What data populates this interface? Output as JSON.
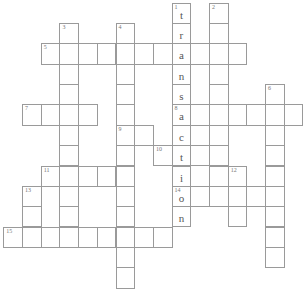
{
  "crossword": {
    "cell_w": 18.7,
    "cell_h": 20.35,
    "origin_x": 3.3,
    "origin_y": 2.7,
    "words": [
      {
        "number": "1",
        "direction": "down",
        "row": 0,
        "col": 9,
        "length": 11,
        "answer": "transaction"
      },
      {
        "number": "2",
        "direction": "down",
        "row": 0,
        "col": 11,
        "length": 9,
        "answer": ""
      },
      {
        "number": "3",
        "direction": "down",
        "row": 1,
        "col": 3,
        "length": 11,
        "answer": ""
      },
      {
        "number": "4",
        "direction": "down",
        "row": 1,
        "col": 6,
        "length": 13,
        "answer": ""
      },
      {
        "number": "5",
        "direction": "across",
        "row": 2,
        "col": 2,
        "length": 11,
        "answer": ""
      },
      {
        "number": "6",
        "direction": "down",
        "row": 4,
        "col": 14,
        "length": 9,
        "answer": ""
      },
      {
        "number": "7",
        "direction": "across",
        "row": 5,
        "col": 1,
        "length": 4,
        "answer": ""
      },
      {
        "number": "8",
        "direction": "across",
        "row": 5,
        "col": 9,
        "length": 7,
        "answer": ""
      },
      {
        "number": "9",
        "direction": "across",
        "row": 6,
        "col": 6,
        "length": 2,
        "answer": ""
      },
      {
        "number": "10",
        "direction": "across",
        "row": 7,
        "col": 8,
        "length": 3,
        "answer": ""
      },
      {
        "number": "11",
        "direction": "across",
        "row": 8,
        "col": 2,
        "length": 5,
        "answer": ""
      },
      {
        "number": "12",
        "direction": "down",
        "row": 8,
        "col": 12,
        "length": 3,
        "answer": ""
      },
      {
        "number": "13",
        "direction": "down",
        "row": 9,
        "col": 1,
        "length": 3,
        "answer": ""
      },
      {
        "number": "14",
        "direction": "across",
        "row": 9,
        "col": 9,
        "length": 6,
        "answer": ""
      },
      {
        "number": "15",
        "direction": "across",
        "row": 11,
        "col": 0,
        "length": 9,
        "answer": ""
      }
    ]
  },
  "colors": {
    "border": "#9a9a9a",
    "number": "#777777",
    "letter": "#555555"
  }
}
